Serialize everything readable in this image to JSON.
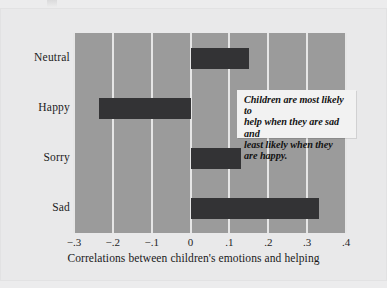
{
  "chart_data": {
    "type": "bar",
    "orientation": "horizontal",
    "title": "",
    "subtitle": "",
    "xlabel": "Correlations between children's emotions and helping",
    "ylabel": "",
    "categories": [
      "Neutral",
      "Happy",
      "Sorry",
      "Sad"
    ],
    "values": [
      0.15,
      -0.235,
      0.13,
      0.33
    ],
    "series": [
      {
        "name": "Correlation with helping",
        "values": [
          0.15,
          -0.235,
          0.13,
          0.33
        ]
      }
    ],
    "xlim": [
      -0.3,
      0.4
    ],
    "ylim": [
      0,
      4
    ],
    "xticks": [
      -0.3,
      -0.2,
      -0.1,
      0,
      0.1,
      0.2,
      0.3,
      0.4
    ],
    "xticklabels": [
      "−.3",
      "−.2",
      "−.1",
      "0",
      ".1",
      ".2",
      ".3",
      ".4"
    ],
    "grid": "vertical",
    "legend": "none",
    "annotations": [
      {
        "text": "Children are most likely to help when they are sad and least likely when they are happy.",
        "lines": [
          "Children are most likely to",
          "help when they are sad and",
          "least likely when they",
          "are happy."
        ]
      }
    ],
    "colors": {
      "bar": "#333335",
      "plot_background": "#9b9b9b",
      "gridline": "#e6e6e6",
      "page_background": "#e9e9ea",
      "annotation_background": "#f2f2f2",
      "text": "#1a1a1a"
    }
  },
  "axis": {
    "x_title": "Correlations between children's emotions and helping",
    "tick_labels": [
      "−.3",
      "−.2",
      "−.1",
      "0",
      ".1",
      ".2",
      ".3",
      ".4"
    ]
  },
  "categories": [
    {
      "label": "Neutral",
      "value": 0.15
    },
    {
      "label": "Happy",
      "value": -0.235
    },
    {
      "label": "Sorry",
      "value": 0.13
    },
    {
      "label": "Sad",
      "value": 0.33
    }
  ],
  "annotation": {
    "line1": "Children are most likely to",
    "line2": "help when they are sad and",
    "line3": "least likely when they",
    "line4": "are happy."
  }
}
